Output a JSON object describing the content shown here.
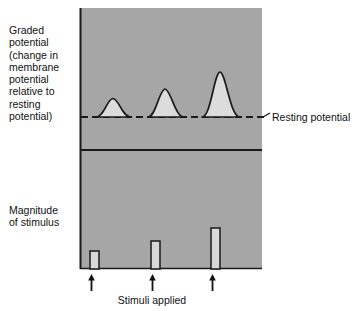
{
  "figure": {
    "labels": {
      "graded_potential": "Graded\npotential\n(change in\nmembrane\npotential\nrelative to\nresting\npotential)",
      "magnitude_of_stimulus": "Magnitude\nof stimulus",
      "resting_potential": "Resting potential",
      "time_axis": "Time",
      "stimuli_applied": "Stimuli applied"
    },
    "colors": {
      "panel_background": "#a6a6a6",
      "curve_fill": "#dcdcdc",
      "bar_fill": "#d8d8d8",
      "stroke": "#1a1a1a",
      "page_background": "#ffffff",
      "text": "#111111"
    },
    "panel": {
      "x": 80,
      "y": 8,
      "width": 182,
      "height": 261,
      "divider_y": 150
    }
  },
  "chart_data": {
    "type": "line",
    "title": "",
    "xlabel": "Time",
    "ylabel": "Graded potential (change in membrane potential relative to resting potential)",
    "grid": false,
    "legend_position": "none",
    "annotations": [
      "Resting potential",
      "Stimuli applied",
      "Time"
    ],
    "panels": [
      {
        "name": "graded-potential",
        "type": "line",
        "baseline_label": "Resting potential",
        "baseline_y": 117,
        "baseline_style": "dashed",
        "series": [
          {
            "name": "graded potential response 1",
            "stimulus_index": 1,
            "peak_x": 113,
            "peak_y": 98,
            "amplitude_px": 19,
            "relative_amplitude": 0.42,
            "half_width_px": 13
          },
          {
            "name": "graded potential response 2",
            "stimulus_index": 2,
            "peak_x": 165,
            "peak_y": 89,
            "amplitude_px": 28,
            "relative_amplitude": 0.62,
            "half_width_px": 14
          },
          {
            "name": "graded potential response 3",
            "stimulus_index": 3,
            "peak_x": 220,
            "peak_y": 72,
            "amplitude_px": 45,
            "relative_amplitude": 1.0,
            "half_width_px": 14
          }
        ]
      },
      {
        "name": "magnitude-of-stimulus",
        "type": "bar",
        "categories": [
          "stimulus 1",
          "stimulus 2",
          "stimulus 3"
        ],
        "values": [
          18,
          28,
          41
        ],
        "relative_values": [
          0.44,
          0.68,
          1.0
        ],
        "baseline_y": 269,
        "bar_width_px": 9,
        "bar_x": [
          90,
          151,
          211
        ]
      }
    ],
    "stimulus_markers": {
      "symbol": "up-arrow",
      "count": 3,
      "x": [
        91,
        152,
        212
      ],
      "label": "Stimuli applied"
    }
  }
}
